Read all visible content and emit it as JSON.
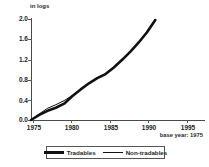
{
  "axes": {
    "unit_caption": "in logs",
    "y_ticks": [
      "2.0",
      "1.6",
      "1.2",
      "0.8",
      "0.4",
      "0.0"
    ],
    "x_ticks": [
      "1975",
      "1980",
      "1985",
      "1990",
      "1995"
    ],
    "y_label": "",
    "x_label": ""
  },
  "note": {
    "base_year": "base year: 1975"
  },
  "legend": {
    "entries": [
      {
        "label": "Tradables",
        "style": "thick"
      },
      {
        "label": "Non-tradables",
        "style": "thin"
      }
    ]
  },
  "colors": {
    "line": "#111111",
    "axis": "#4a4a4a",
    "text": "#232323",
    "background": "#ffffff"
  },
  "chart_data": {
    "type": "line",
    "title": "",
    "subtitle": "",
    "xlabel": "",
    "ylabel": "in logs",
    "unit_caption": "in logs",
    "annotations": [
      "base year: 1975"
    ],
    "xlim": [
      1975,
      1996
    ],
    "ylim": [
      0.0,
      2.0
    ],
    "x_ticks": [
      1975,
      1980,
      1985,
      1990,
      1995
    ],
    "y_ticks": [
      0.0,
      0.4,
      0.8,
      1.2,
      1.6,
      2.0
    ],
    "grid": false,
    "legend_position": "bottom",
    "x": [
      1975,
      1976,
      1977,
      1978,
      1979,
      1980,
      1981,
      1982,
      1983,
      1984,
      1985,
      1986,
      1987,
      1988,
      1989,
      1990
    ],
    "series": [
      {
        "name": "Tradables",
        "style": "thick",
        "color": "#111111",
        "values": [
          0.0,
          0.1,
          0.18,
          0.24,
          0.32,
          0.47,
          0.6,
          0.72,
          0.82,
          0.9,
          1.03,
          1.18,
          1.34,
          1.52,
          1.72,
          1.96
        ]
      },
      {
        "name": "Non-tradables",
        "style": "thin",
        "color": "#111111",
        "values": [
          0.0,
          0.12,
          0.23,
          0.3,
          0.38,
          0.48,
          0.61,
          0.73,
          0.83,
          0.91,
          1.04,
          1.19,
          1.35,
          1.53,
          1.73,
          1.97
        ]
      }
    ]
  }
}
